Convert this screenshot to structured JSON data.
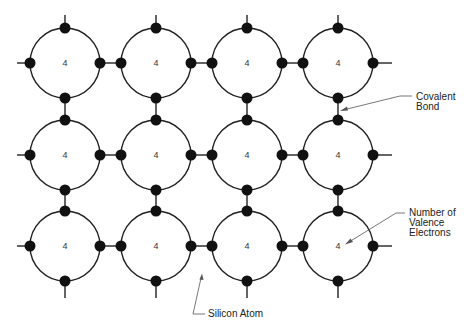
{
  "diagram": {
    "type": "silicon-crystal-lattice",
    "colors": {
      "line": "#222222",
      "electron": "#111111",
      "arrow": "#555555",
      "background": "#ffffff"
    },
    "grid": {
      "rows": 3,
      "cols": 4,
      "centers_x": [
        65,
        156,
        247,
        338
      ],
      "centers_y": [
        63,
        155,
        246
      ],
      "atom_radius": 35,
      "electron_radius": 5.5
    },
    "atoms": [
      {
        "row": 0,
        "col": 0,
        "label": "4"
      },
      {
        "row": 0,
        "col": 1,
        "label": "4"
      },
      {
        "row": 0,
        "col": 2,
        "label": "4"
      },
      {
        "row": 0,
        "col": 3,
        "label": "4"
      },
      {
        "row": 1,
        "col": 0,
        "label": "4"
      },
      {
        "row": 1,
        "col": 1,
        "label": "4"
      },
      {
        "row": 1,
        "col": 2,
        "label": "4"
      },
      {
        "row": 1,
        "col": 3,
        "label": "4"
      },
      {
        "row": 2,
        "col": 0,
        "label": "4"
      },
      {
        "row": 2,
        "col": 1,
        "label": "4"
      },
      {
        "row": 2,
        "col": 2,
        "label": "4"
      },
      {
        "row": 2,
        "col": 3,
        "label": "4"
      }
    ],
    "callouts": {
      "covalent_bond": {
        "line1": "Covalent",
        "line2": "Bond"
      },
      "valence": {
        "line1": "Number of",
        "line2": "Valence",
        "line3": "Electrons"
      },
      "silicon_atom": {
        "line1": "Silicon Atom"
      }
    }
  }
}
